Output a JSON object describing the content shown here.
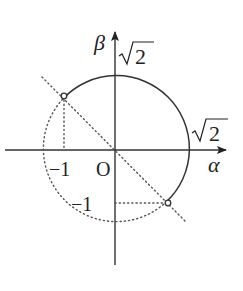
{
  "figure": {
    "type": "unit-circle-diagram",
    "axes": {
      "x_label": "α",
      "y_label": "β",
      "origin_label": "O"
    },
    "labels": {
      "sqrt2_top": "2",
      "sqrt2_right": "2",
      "neg1_x": "−1",
      "neg1_y": "−1"
    },
    "geometry": {
      "origin_px": [
        115,
        150
      ],
      "radius_px": 73,
      "solid_arc": "from (-1,1) counterclockwise-through-top-and-right to (1,-1)",
      "dotted_arc": "from (1,-1) through bottom-left to (-1,1)",
      "open_points": [
        [
          -1,
          1
        ],
        [
          1,
          -1
        ]
      ],
      "dotted_line": "β = -α"
    },
    "colors": {
      "stroke": "#333333",
      "background": "#ffffff"
    }
  }
}
